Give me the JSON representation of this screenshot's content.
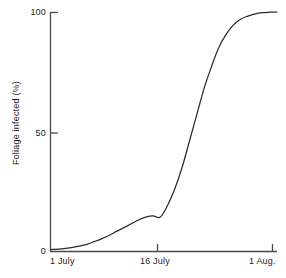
{
  "chart_data": {
    "type": "line",
    "title": "",
    "subtitle": "",
    "xlabel": "",
    "ylabel": "Foliage infected (%)",
    "grid": false,
    "legend": false,
    "legend_position": "none",
    "line_color": "#2b2b2b",
    "axis_color": "#4a4a4a",
    "background": "#ffffff",
    "xlim": [
      0,
      31
    ],
    "ylim": [
      0,
      100
    ],
    "x_tick_values": [
      0,
      15,
      30
    ],
    "x_tick_labels": [
      "1 July",
      "16 July",
      "1 Aug."
    ],
    "y_tick_values": [
      0,
      50,
      100
    ],
    "y_tick_labels": [
      "0",
      "50",
      "100"
    ],
    "series": [
      {
        "name": "Foliage infected",
        "x": [
          0,
          1,
          2,
          3,
          4,
          5,
          6,
          7,
          8,
          9,
          10,
          11,
          12,
          13,
          14,
          15,
          16,
          17,
          18,
          19,
          20,
          21,
          22,
          23,
          24,
          25,
          26,
          27,
          28,
          29,
          30,
          31
        ],
        "values": [
          0.4,
          0.6,
          0.9,
          1.3,
          1.9,
          2.7,
          3.8,
          5.0,
          6.4,
          8.0,
          9.6,
          11.2,
          12.8,
          14.0,
          14.5,
          14.0,
          19.0,
          26.0,
          35.0,
          46.0,
          57.0,
          68.0,
          77.0,
          85.0,
          90.5,
          94.5,
          97.0,
          98.3,
          99.2,
          99.7,
          99.9,
          100.0
        ]
      }
    ],
    "annotations": []
  },
  "axis": {
    "y_title": "Foliage infected (%)",
    "y_ticks": [
      "100",
      "50",
      "0"
    ],
    "x_ticks": [
      "1 July",
      "16 July",
      "1 Aug."
    ]
  }
}
